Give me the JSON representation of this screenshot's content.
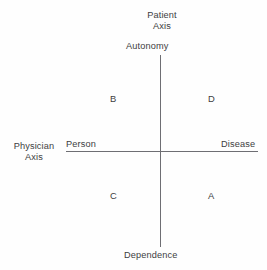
{
  "diagram": {
    "type": "two-axis-quadrant-diagram",
    "background_color": "#fefefe",
    "line_color": "#6e6e73",
    "text_color": "#3d3d41",
    "vertical_axis": {
      "name": "Patient Axis",
      "title_line_1": "Patient",
      "title_line_2": "Axis",
      "top_pole_label": "Autonomy",
      "bottom_pole_label": "Dependence"
    },
    "horizontal_axis": {
      "name": "Physician Axis",
      "title_line_1": "Physician",
      "title_line_2": "Axis",
      "left_pole_label": "Person",
      "right_pole_label": "Disease"
    },
    "quadrants": [
      {
        "letter": "B",
        "position": "upper-left",
        "vertical_pole": "Autonomy",
        "horizontal_pole": "Person"
      },
      {
        "letter": "D",
        "position": "upper-right",
        "vertical_pole": "Autonomy",
        "horizontal_pole": "Disease"
      },
      {
        "letter": "C",
        "position": "lower-left",
        "vertical_pole": "Dependence",
        "horizontal_pole": "Person"
      },
      {
        "letter": "A",
        "position": "lower-right",
        "vertical_pole": "Dependence",
        "horizontal_pole": "Disease"
      }
    ]
  }
}
